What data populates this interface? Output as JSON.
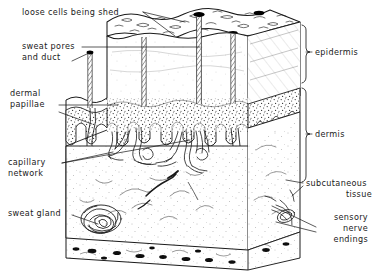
{
  "figure": {
    "ink_color": "#1b1b1b",
    "background_color": "#ffffff",
    "stipple_color": "#2a2a2a",
    "pore_color": "#000000"
  },
  "labels": {
    "loose_cells": "loose cells being shed",
    "sweat_pores_line1": "sweat pores",
    "sweat_pores_line2": "and duct",
    "dermal_papillae_line1": "dermal",
    "dermal_papillae_line2": "papillae",
    "capillary_line1": "capillary",
    "capillary_line2": "network",
    "sweat_gland": "sweat gland",
    "epidermis": "epidermis",
    "dermis": "dermis",
    "subcutaneous_line1": "subcutaneous",
    "subcutaneous_line2": "tissue",
    "sensory_line1": "sensory",
    "sensory_line2": "nerve",
    "sensory_line3": "endings"
  },
  "structures": [
    {
      "name": "loose-cells-being-shed",
      "region": "epidermis-surface"
    },
    {
      "name": "sweat-pores-and-duct",
      "region": "epidermis"
    },
    {
      "name": "dermal-papillae",
      "region": "epidermis-dermis-boundary"
    },
    {
      "name": "capillary-network",
      "region": "dermis"
    },
    {
      "name": "sweat-gland",
      "region": "dermis"
    },
    {
      "name": "sensory-nerve-endings",
      "region": "subcutaneous-tissue"
    }
  ],
  "brackets": [
    {
      "name": "epidermis",
      "label": "epidermis"
    },
    {
      "name": "dermis",
      "label": "dermis"
    }
  ]
}
